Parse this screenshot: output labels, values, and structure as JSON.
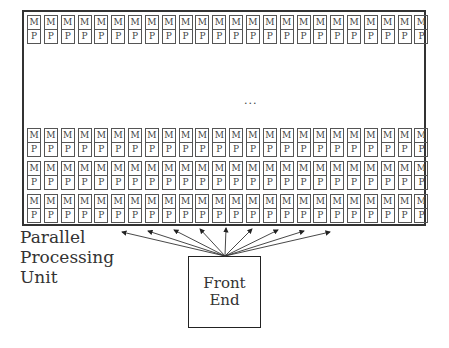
{
  "diagram": {
    "processing_unit": {
      "label_lines": [
        "Parallel",
        "Processing",
        "Unit"
      ],
      "columns": 24,
      "visible_rows": 4,
      "element": {
        "memory_label": "M",
        "processor_label": "P"
      },
      "ellipsis": "..."
    },
    "front_end": {
      "label_lines": [
        "Front",
        "End"
      ]
    },
    "arrows": {
      "count": 9,
      "from": "front_end",
      "to": "processing_unit"
    }
  }
}
